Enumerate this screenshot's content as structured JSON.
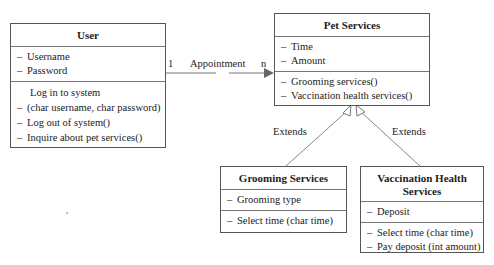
{
  "classes": {
    "user": {
      "name": "User",
      "attributes": [
        "Username",
        "Password"
      ],
      "methods": [
        "Log in to system",
        "(char username, char password)",
        "Log out of system()",
        "Inquire about pet services()"
      ]
    },
    "pet_services": {
      "name": "Pet Services",
      "attributes": [
        "Time",
        "Amount"
      ],
      "methods": [
        "Grooming services()",
        "Vaccination health services()"
      ]
    },
    "grooming_services": {
      "name": "Grooming Services",
      "attributes": [
        "Grooming type"
      ],
      "methods": [
        "Select time (char time)"
      ]
    },
    "vaccination_services": {
      "name": "Vaccination Health Services",
      "attributes": [
        "Deposit"
      ],
      "methods": [
        "Select time (char time)",
        "Pay deposit (int amount)"
      ]
    }
  },
  "relations": {
    "association": {
      "label": "Appointment",
      "from_mult": "1",
      "to_mult": "n"
    },
    "extends_left": {
      "label": "Extends"
    },
    "extends_right": {
      "label": "Extends"
    }
  },
  "dash": "–"
}
